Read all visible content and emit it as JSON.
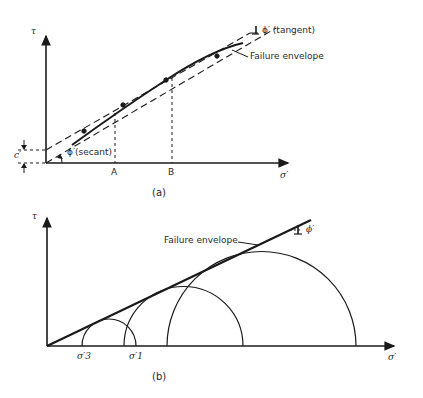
{
  "figure": {
    "panels": [
      {
        "id": "a",
        "caption": "(a)",
        "y_axis_label": "τ",
        "x_axis_label": "σ′",
        "intercept_label": "c′",
        "angle_secant_label": "ϕ′(secant)",
        "angle_tangent_label": "ϕ′ (tangent)",
        "envelope_label": "Failure envelope",
        "x_markers": [
          "A",
          "B"
        ]
      },
      {
        "id": "b",
        "caption": "(b)",
        "y_axis_label": "τ",
        "x_axis_label": "σ′",
        "envelope_label": "Failure envelope",
        "angle_label": "ϕ′",
        "sigma3_label": "σ′3",
        "sigma1_label": "σ′1",
        "mohr_circles": 3
      }
    ]
  },
  "colors": {
    "ink": "#1a1a1a",
    "background": "#ffffff"
  }
}
